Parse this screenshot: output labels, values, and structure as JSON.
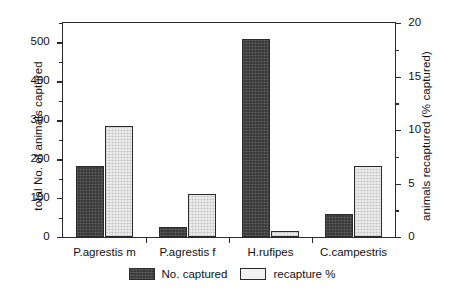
{
  "chart_data": {
    "type": "bar",
    "title": "",
    "subtitle": "",
    "xlabel": "",
    "ylabel": "total No. of animals captured",
    "y2label": "animals recaptured (% captured)",
    "categories": [
      "P.agrestis m",
      "P.agrestis f",
      "H.rufipes",
      "C.campestris"
    ],
    "series": [
      {
        "name": "No. captured",
        "axis": "left",
        "color": "#3a3a3a",
        "values": [
          182,
          25,
          508,
          60
        ]
      },
      {
        "name": "recapture %",
        "axis": "right",
        "color": "#ececec",
        "values": [
          10.4,
          4.0,
          0.6,
          6.6
        ]
      }
    ],
    "ylim": [
      0,
      550
    ],
    "y2lim": [
      0,
      20
    ],
    "yticks": [
      0,
      100,
      200,
      300,
      400,
      500
    ],
    "yticklabels": [
      "0",
      "100",
      "200",
      "300",
      "400",
      "500"
    ],
    "yminorticks": [
      50,
      150,
      250,
      350,
      450,
      550
    ],
    "y2ticks": [
      0,
      5,
      10,
      15,
      20
    ],
    "y2ticklabels": [
      "0",
      "5",
      "10",
      "15",
      "20"
    ],
    "y2minorticks": [
      2.5,
      7.5,
      12.5,
      17.5
    ],
    "grid": false,
    "legend_position": "bottom-center",
    "legend": [
      "No. captured",
      "recapture %"
    ]
  },
  "axes": {
    "left_title": "total No. of animals captured",
    "right_title": "animals recaptured (% captured)"
  },
  "legend": {
    "captured_label": "No. captured",
    "recapture_label": "recapture %"
  }
}
